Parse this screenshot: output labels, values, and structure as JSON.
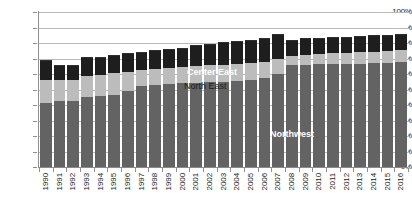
{
  "chart_data": {
    "type": "bar",
    "stacked": true,
    "title": "",
    "subtitle": "",
    "xlabel": "",
    "ylabel": "",
    "ylim": [
      0,
      100
    ],
    "ytick_labels": [
      "100%",
      "90%",
      "80%",
      "70%",
      "60%",
      "50%",
      "40%",
      "30%",
      "20%",
      "10%",
      "0%"
    ],
    "ytick_values": [
      100,
      90,
      80,
      70,
      60,
      50,
      40,
      30,
      20,
      10,
      0
    ],
    "grid": true,
    "legend_position": "in-plot",
    "categories": [
      "1990",
      "1991",
      "1992",
      "1993",
      "1994",
      "1995",
      "1996",
      "1997",
      "1998",
      "1999",
      "2000",
      "2001",
      "2002",
      "2003",
      "2004",
      "2005",
      "2006",
      "2007",
      "2008",
      "2009",
      "2010",
      "2011",
      "2012",
      "2013",
      "2014",
      "2015",
      "2016"
    ],
    "series": [
      {
        "name": "Northwest",
        "color": "#636363",
        "values": [
          41.5,
          42.5,
          42.5,
          45.0,
          45.5,
          46.5,
          49.0,
          52.5,
          53.0,
          53.5,
          54.5,
          54.5,
          55.0,
          55.0,
          55.5,
          56.0,
          57.5,
          60.0,
          65.5,
          66.0,
          66.5,
          66.5,
          66.5,
          66.5,
          67.0,
          67.0,
          67.5
        ]
      },
      {
        "name": "North East",
        "color": "#bcbcbc",
        "values": [
          14.5,
          13.5,
          13.5,
          14.0,
          14.0,
          14.0,
          12.0,
          10.0,
          10.5,
          10.5,
          10.0,
          10.5,
          10.5,
          11.0,
          11.0,
          11.0,
          10.5,
          9.5,
          6.0,
          6.5,
          6.5,
          7.0,
          7.0,
          7.5,
          7.5,
          8.0,
          8.0
        ]
      },
      {
        "name": "Center East",
        "color": "#1e1e1e",
        "values": [
          13.0,
          9.5,
          9.5,
          12.0,
          11.5,
          11.5,
          12.5,
          12.0,
          12.0,
          12.0,
          12.5,
          13.5,
          14.0,
          14.5,
          14.5,
          15.0,
          15.5,
          16.0,
          10.5,
          10.5,
          10.5,
          10.5,
          10.5,
          10.5,
          10.5,
          10.5,
          10.5
        ]
      }
    ],
    "totals": [
      69.0,
      65.5,
      65.5,
      71.0,
      71.0,
      72.0,
      73.5,
      74.5,
      75.5,
      76.0,
      77.0,
      78.5,
      79.5,
      80.5,
      81.0,
      82.0,
      83.5,
      85.5,
      82.0,
      83.0,
      83.5,
      84.0,
      84.0,
      84.5,
      85.0,
      85.5,
      86.0
    ],
    "annotations": [
      {
        "text": "Center East",
        "series": "Center East",
        "style": "light"
      },
      {
        "text": "North East",
        "series": "North East",
        "style": "dark"
      },
      {
        "text": "Northwest",
        "series": "Northwest",
        "style": "light"
      }
    ]
  }
}
